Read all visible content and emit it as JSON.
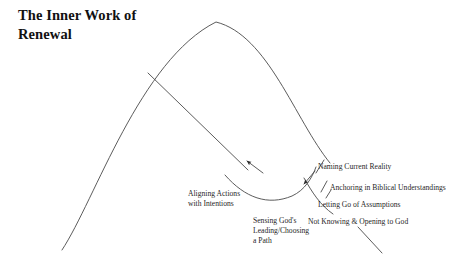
{
  "page": {
    "title": "The Inner Work of Renewal",
    "title_lines": "The Inner Work of\nRenewal",
    "background_color": "#ffffff",
    "line_color": "#4a4a4a",
    "text_color": "#1f1f1f"
  },
  "diagram": {
    "type": "conceptual-arc-diagram",
    "labels": {
      "naming_current_reality": "Naming Current Reality",
      "anchoring_in_biblical_understandings": "Anchoring in Biblical Understandings",
      "letting_go_of_assumptions": "Letting Go of Assumptions",
      "not_knowing_and_opening_to_god": "Not Knowing & Opening to God",
      "aligning_actions_with_intentions": "Aligning Actions\nwith Intentions",
      "sensing_gods_leading": "Sensing God's\nLeading/Choosing\na Path"
    },
    "arrows": [
      {
        "name": "upward-left-arrow",
        "direction": "up-left"
      },
      {
        "name": "downward-left-arrow",
        "direction": "down-left"
      }
    ]
  }
}
